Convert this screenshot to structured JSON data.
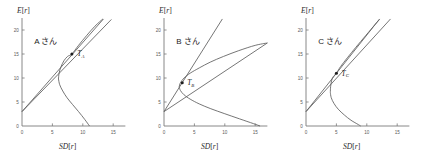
{
  "figure": {
    "panel_count": 3,
    "axis": {
      "x_title_prefix": "SD",
      "x_title_bracket_open": "[",
      "x_title_var": "r",
      "x_title_bracket_close": "]",
      "y_title_prefix": "E",
      "y_title_bracket_open": "[",
      "y_title_var": "r",
      "y_title_bracket_close": "]",
      "x_ticks": [
        "0",
        "5",
        "10",
        "15"
      ],
      "y_ticks": [
        "0",
        "5",
        "10",
        "15",
        "20"
      ],
      "xlim": [
        0,
        17
      ],
      "ylim": [
        0,
        22.5
      ]
    },
    "colors": {
      "curve": "#5d5d5d",
      "axis": "#7a7a7a",
      "text": "#1d1d1d",
      "ticklabel": "#5a5a5a",
      "point": "#1d1d1d",
      "background": "#ffffff"
    }
  },
  "chart_data": [
    {
      "type": "line",
      "title": "A さん",
      "person_label": "A さん",
      "xlabel": "SD[r]",
      "ylabel": "E[r]",
      "xlim": [
        0,
        17
      ],
      "ylim": [
        0,
        22.5
      ],
      "xticks": [
        0,
        5,
        10,
        15
      ],
      "yticks": [
        0,
        5,
        10,
        15,
        20
      ],
      "grid": false,
      "legend": "none",
      "risk_free_rate": 3.0,
      "tangency_point": {
        "label": "T",
        "sub": "A",
        "sd": 8.2,
        "er": 15.0
      },
      "label_offset": {
        "dx": 5.5,
        "dy": 2.4
      },
      "frontier": {
        "shape": "hyperbola",
        "vertex_sd": 6.0,
        "vertex_er": 9.8,
        "scale_sd": 6.0,
        "curvature": 0.62,
        "upper_end_er": 22.0,
        "lower_end_er": 0.0,
        "points_upper": [
          [
            6.0,
            9.8
          ],
          [
            6.1,
            11.0
          ],
          [
            6.4,
            12.3
          ],
          [
            6.9,
            13.6
          ],
          [
            7.5,
            14.5
          ],
          [
            8.2,
            15.0
          ],
          [
            9.3,
            16.8
          ],
          [
            10.6,
            18.8
          ],
          [
            12.0,
            20.8
          ],
          [
            13.3,
            22.3
          ]
        ],
        "points_lower": [
          [
            6.0,
            9.8
          ],
          [
            6.2,
            8.6
          ],
          [
            6.7,
            7.3
          ],
          [
            7.4,
            5.9
          ],
          [
            8.3,
            4.5
          ],
          [
            9.3,
            3.0
          ],
          [
            10.3,
            1.4
          ],
          [
            11.1,
            0.0
          ]
        ]
      },
      "lines": [
        {
          "name": "capital-market-line",
          "from": [
            0.0,
            3.0
          ],
          "to": [
            14.7,
            22.2
          ]
        },
        {
          "name": "tangent-extension",
          "from": [
            0.0,
            3.0
          ],
          "to": [
            13.4,
            22.3
          ]
        }
      ]
    },
    {
      "type": "line",
      "title": "B さん",
      "person_label": "B さん",
      "xlabel": "SD[r]",
      "ylabel": "E[r]",
      "xlim": [
        0,
        17
      ],
      "ylim": [
        0,
        22.5
      ],
      "xticks": [
        0,
        5,
        10,
        15
      ],
      "yticks": [
        0,
        5,
        10,
        15,
        20
      ],
      "grid": false,
      "legend": "none",
      "risk_free_rate": 3.0,
      "tangency_point": {
        "label": "T",
        "sub": "B",
        "sd": 3.0,
        "er": 9.0
      },
      "label_offset": {
        "dx": 5.0,
        "dy": 2.6
      },
      "frontier": {
        "shape": "hyperbola",
        "vertex_sd": 2.5,
        "vertex_er": 8.2,
        "scale_sd": 2.5,
        "curvature": 0.21,
        "upper_end_er": 17.2,
        "lower_end_er": 0.0,
        "points_upper": [
          [
            2.5,
            8.2
          ],
          [
            2.7,
            9.0
          ],
          [
            3.3,
            10.0
          ],
          [
            4.3,
            11.0
          ],
          [
            5.8,
            12.1
          ],
          [
            7.6,
            13.3
          ],
          [
            9.8,
            14.5
          ],
          [
            12.3,
            15.7
          ],
          [
            15.0,
            16.8
          ],
          [
            17.0,
            17.3
          ]
        ],
        "points_lower": [
          [
            2.5,
            8.2
          ],
          [
            2.7,
            7.4
          ],
          [
            3.3,
            6.5
          ],
          [
            4.3,
            5.6
          ],
          [
            5.8,
            4.6
          ],
          [
            7.7,
            3.6
          ],
          [
            9.9,
            2.6
          ],
          [
            12.4,
            1.5
          ],
          [
            14.7,
            0.5
          ],
          [
            15.8,
            0.0
          ]
        ]
      },
      "lines": [
        {
          "name": "capital-market-line",
          "from": [
            0.0,
            3.0
          ],
          "to": [
            9.6,
            22.3
          ]
        },
        {
          "name": "tangent-extension",
          "from": [
            0.0,
            3.0
          ],
          "to": [
            17.0,
            17.3
          ]
        }
      ]
    },
    {
      "type": "line",
      "title": "C さん",
      "person_label": "C さん",
      "xlabel": "SD[r]",
      "ylabel": "E[r]",
      "xlim": [
        0,
        17
      ],
      "ylim": [
        0,
        22.5
      ],
      "xticks": [
        0,
        5,
        10,
        15
      ],
      "yticks": [
        0,
        5,
        10,
        15,
        20
      ],
      "grid": false,
      "legend": "none",
      "risk_free_rate": 3.0,
      "tangency_point": {
        "label": "T",
        "sub": "C",
        "sd": 5.0,
        "er": 11.0
      },
      "label_offset": {
        "dx": 5.2,
        "dy": 2.5
      },
      "frontier": {
        "shape": "hyperbola",
        "vertex_sd": 4.0,
        "vertex_er": 7.0,
        "scale_sd": 4.0,
        "curvature": 0.9,
        "upper_end_er": 22.0,
        "lower_end_er": 0.0,
        "points_upper": [
          [
            4.0,
            7.0
          ],
          [
            4.05,
            8.2
          ],
          [
            4.2,
            9.4
          ],
          [
            4.5,
            10.3
          ],
          [
            5.0,
            11.0
          ],
          [
            5.7,
            12.4
          ],
          [
            6.8,
            14.2
          ],
          [
            8.2,
            16.4
          ],
          [
            9.8,
            18.8
          ],
          [
            11.4,
            21.2
          ],
          [
            12.1,
            22.2
          ]
        ],
        "points_lower": [
          [
            4.0,
            7.0
          ],
          [
            4.15,
            5.9
          ],
          [
            4.6,
            4.7
          ],
          [
            5.3,
            3.5
          ],
          [
            6.3,
            2.3
          ],
          [
            7.4,
            1.2
          ],
          [
            8.6,
            0.3
          ],
          [
            9.0,
            0.0
          ]
        ]
      },
      "lines": [
        {
          "name": "capital-market-line",
          "from": [
            0.0,
            3.0
          ],
          "to": [
            12.1,
            22.3
          ]
        },
        {
          "name": "tangent-extension",
          "from": [
            0.0,
            3.0
          ],
          "to": [
            13.9,
            22.3
          ]
        }
      ]
    }
  ]
}
